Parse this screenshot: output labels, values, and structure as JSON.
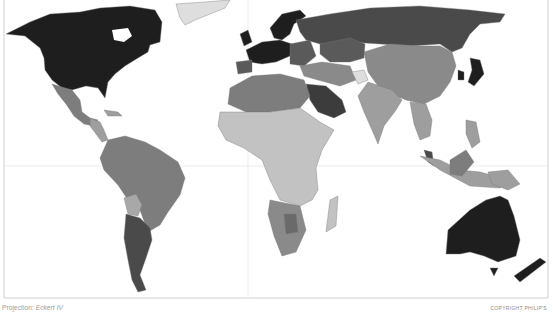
{
  "map": {
    "type": "choropleth world map",
    "projection_label": "Projection:",
    "projection_name": "Eckert IV",
    "copyright": "COPYRIGHT PHILIP'S",
    "color_scale": [
      "#1e1e1e",
      "#3c3c3c",
      "#5a5a5a",
      "#7d7d7d",
      "#9e9e9e",
      "#c2c2c2",
      "#dedede"
    ],
    "regions": [
      {
        "name": "North America (USA/Canada)",
        "shade": "#1e1e1e"
      },
      {
        "name": "Greenland",
        "shade": "#dedede"
      },
      {
        "name": "Mexico",
        "shade": "#7d7d7d"
      },
      {
        "name": "Central America",
        "shade": "#9e9e9e"
      },
      {
        "name": "South America (Brazil, Andes)",
        "shade": "#7d7d7d"
      },
      {
        "name": "Bolivia",
        "shade": "#a8a8a8"
      },
      {
        "name": "Argentina/Chile",
        "shade": "#4a4a4a"
      },
      {
        "name": "Western Europe",
        "shade": "#1e1e1e"
      },
      {
        "name": "Spain",
        "shade": "#5a5a5a"
      },
      {
        "name": "Eastern Europe",
        "shade": "#5a5a5a"
      },
      {
        "name": "Russia",
        "shade": "#4a4a4a"
      },
      {
        "name": "Kazakhstan",
        "shade": "#5a5a5a"
      },
      {
        "name": "China/Mongolia",
        "shade": "#8a8a8a"
      },
      {
        "name": "India",
        "shade": "#9e9e9e"
      },
      {
        "name": "Middle East (Saudi Arabia)",
        "shade": "#3c3c3c"
      },
      {
        "name": "North Africa",
        "shade": "#7d7d7d"
      },
      {
        "name": "Sub-Saharan Africa",
        "shade": "#c2c2c2"
      },
      {
        "name": "Southern Africa",
        "shade": "#8a8a8a"
      },
      {
        "name": "Japan/Korea",
        "shade": "#1e1e1e"
      },
      {
        "name": "Southeast Asia",
        "shade": "#9e9e9e"
      },
      {
        "name": "Malaysia",
        "shade": "#4a4a4a"
      },
      {
        "name": "Australia",
        "shade": "#1e1e1e"
      },
      {
        "name": "New Zealand",
        "shade": "#1e1e1e"
      }
    ]
  }
}
